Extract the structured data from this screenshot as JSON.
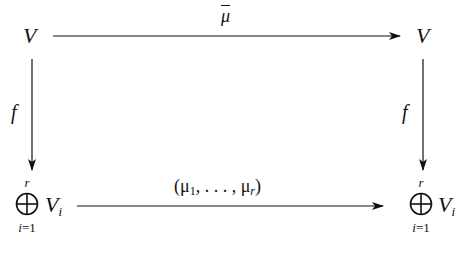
{
  "diagram": {
    "type": "commutative-diagram",
    "nodes": {
      "top_left": {
        "symbol": "V"
      },
      "top_right": {
        "symbol": "V"
      },
      "bottom_left": {
        "operator": "⊕",
        "upper": "r",
        "lower_var": "i",
        "lower_eq": "=1",
        "base": "V",
        "subscript": "i"
      },
      "bottom_right": {
        "operator": "⊕",
        "upper": "r",
        "lower_var": "i",
        "lower_eq": "=1",
        "base": "V",
        "subscript": "i"
      }
    },
    "arrows": {
      "top": {
        "from": "V",
        "to": "V",
        "label": "μ",
        "label_decoration": "overline"
      },
      "left": {
        "from": "V",
        "to": "⊕ V_i",
        "label": "f"
      },
      "right": {
        "from": "V",
        "to": "⊕ V_i",
        "label": "f"
      },
      "bottom": {
        "from": "⊕ V_i",
        "to": "⊕ V_i",
        "label_open": "(μ",
        "label_sub1": "1",
        "label_mid": ", . . . , μ",
        "label_subr": "r",
        "label_close": ")"
      }
    },
    "colors": {
      "stroke": "#111111",
      "background": "#ffffff"
    }
  }
}
